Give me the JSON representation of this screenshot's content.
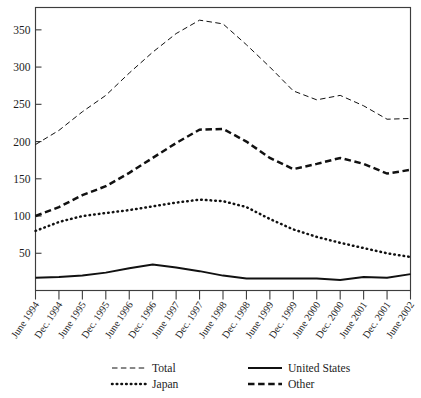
{
  "chart_data": {
    "type": "line",
    "title": "",
    "subtitle": "",
    "xlabel": "",
    "ylabel": "",
    "grid": false,
    "legend_position": "bottom",
    "ylim": [
      0,
      380
    ],
    "yticks": [
      50,
      100,
      150,
      200,
      250,
      300,
      350
    ],
    "ytick_labels": [
      "50",
      "100",
      "150",
      "200",
      "250",
      "300",
      "350"
    ],
    "x": [
      "June 1994",
      "Dec. 1994",
      "June 1995",
      "Dec. 1995",
      "June 1996",
      "Dec. 1996",
      "June 1997",
      "Dec. 1997",
      "June 1998",
      "Dec. 1998",
      "June 1999",
      "Dec. 1999",
      "June 2000",
      "Dec. 2000",
      "June 2001",
      "Dec. 2001",
      "June 2002"
    ],
    "series": [
      {
        "name": "Total",
        "style": "thin-dashed",
        "values": [
          196,
          215,
          240,
          262,
          292,
          320,
          345,
          363,
          358,
          330,
          300,
          268,
          256,
          262,
          248,
          230,
          231
        ]
      },
      {
        "name": "Japan",
        "style": "dotted",
        "values": [
          80,
          92,
          100,
          104,
          108,
          113,
          118,
          122,
          120,
          112,
          96,
          82,
          72,
          64,
          57,
          50,
          45
        ]
      },
      {
        "name": "United States",
        "style": "solid",
        "values": [
          17,
          18,
          20,
          24,
          30,
          35,
          31,
          26,
          20,
          16,
          16,
          16,
          16,
          14,
          18,
          17,
          22
        ]
      },
      {
        "name": "Other",
        "style": "thick-dashed",
        "values": [
          100,
          112,
          128,
          140,
          158,
          178,
          198,
          216,
          217,
          200,
          178,
          163,
          170,
          178,
          170,
          157,
          162
        ]
      }
    ]
  },
  "legend": {
    "items": [
      {
        "label": "Total",
        "style": "thin-dashed"
      },
      {
        "label": "United States",
        "style": "solid"
      },
      {
        "label": "Japan",
        "style": "dotted"
      },
      {
        "label": "Other",
        "style": "thick-dashed"
      }
    ]
  }
}
